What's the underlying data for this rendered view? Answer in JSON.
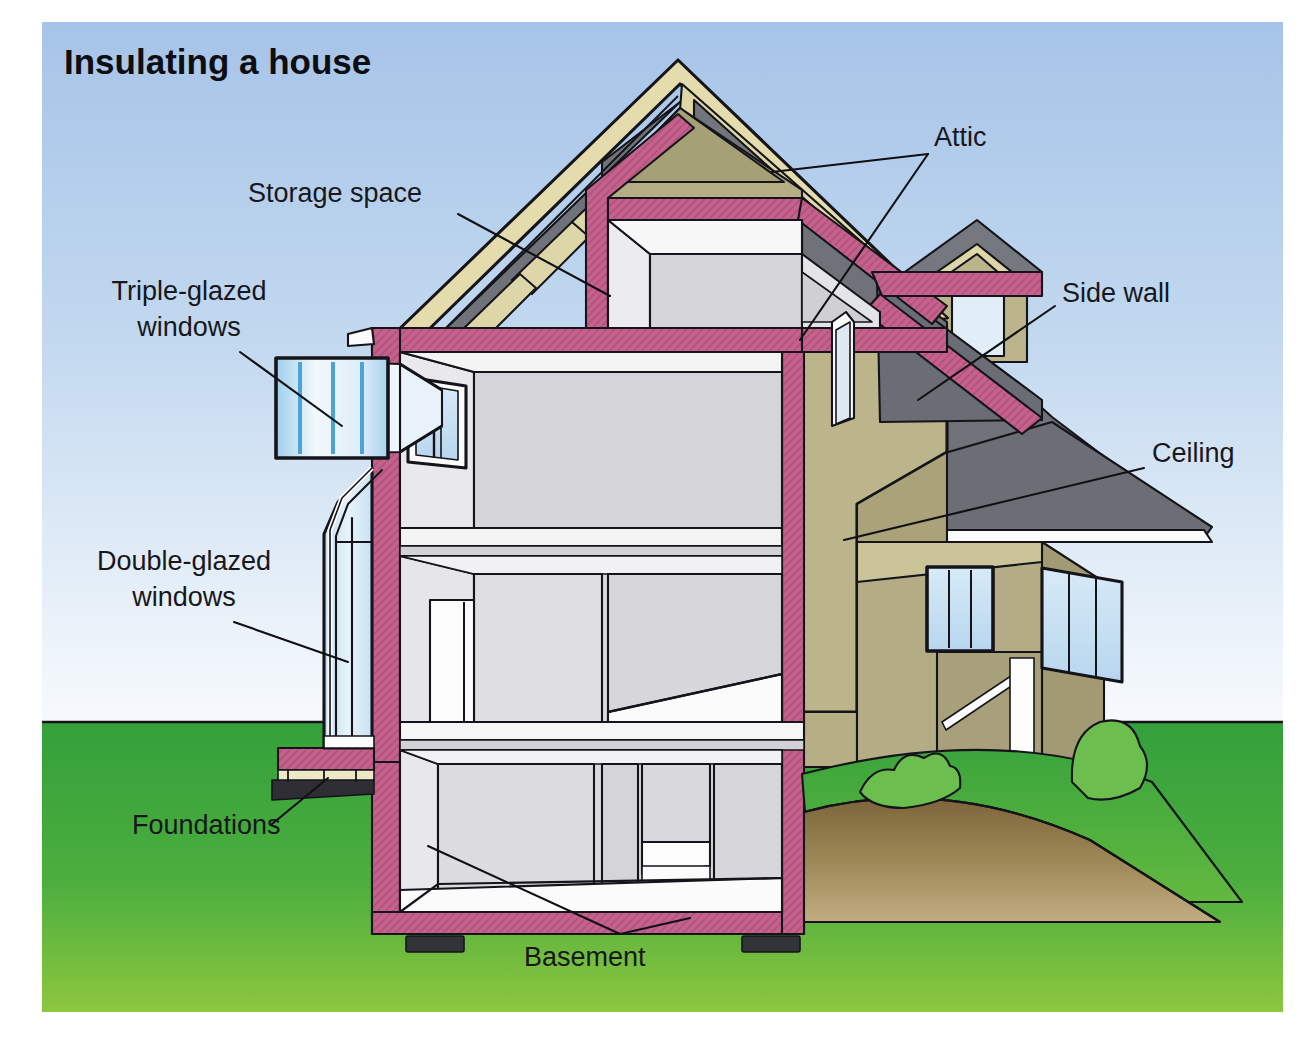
{
  "figure": {
    "title": "Insulating a house",
    "kind": "cutaway-illustration"
  },
  "labels": [
    {
      "id": "attic",
      "text": "Attic",
      "lines": [
        "Attic"
      ]
    },
    {
      "id": "storage",
      "text": "Storage space",
      "lines": [
        "Storage space"
      ]
    },
    {
      "id": "sidewall",
      "text": "Side wall",
      "lines": [
        "Side wall"
      ]
    },
    {
      "id": "ceiling",
      "text": "Ceiling",
      "lines": [
        "Ceiling"
      ]
    },
    {
      "id": "triple",
      "text": "Triple-glazed windows",
      "lines": [
        "Triple-glazed",
        "windows"
      ]
    },
    {
      "id": "double",
      "text": "Double-glazed windows",
      "lines": [
        "Double-glazed",
        "windows"
      ]
    },
    {
      "id": "foundations",
      "text": "Foundations",
      "lines": [
        "Foundations"
      ]
    },
    {
      "id": "basement",
      "text": "Basement",
      "lines": [
        "Basement"
      ]
    }
  ],
  "colors": {
    "sky_top": "#a9c6e8",
    "sky_bottom": "#f4f8fc",
    "grass_top": "#35a03c",
    "grass_bottom": "#8cc63f",
    "insulation_pink": "#c4628c",
    "insulation_pink_dark": "#a84f76",
    "wall_tan": "#bcb48a",
    "wall_tan_dark": "#a9a078",
    "roof_gray": "#7c7f85",
    "roof_gray_dark": "#5e6166",
    "roof_gray_light": "#9a9da2",
    "rafter_tan": "#ddd6a8",
    "interior_gray": "#d8d8dc",
    "interior_gray_light": "#e6e6ea",
    "interior_white": "#fbfbfb",
    "glass_blue": "#cfe4f3",
    "glass_blue_mid": "#9cc9e6",
    "glass_blue_deep": "#4ba3d8",
    "soil_brown": "#8a7248",
    "soil_brown_light": "#b5a078",
    "bush_green": "#6cbf4f",
    "footing_dark": "#2b2b30",
    "outline": "#14141a",
    "text": "#17171c"
  },
  "figure_parts": {
    "sky": "sky-background",
    "ground": "grass-ground",
    "soil": "soil-cross-section",
    "roof": "roof-assembly",
    "attic_space": "attic-void",
    "storage_space": "attic-storage-void",
    "insulation": "pink-insulation-layer",
    "conservatory": "double-glazed-conservatory",
    "window_detail": "triple-glazed-window-detail-inset",
    "basement": "basement-room",
    "footings": "foundation-footings",
    "bushes": "shrubs"
  }
}
